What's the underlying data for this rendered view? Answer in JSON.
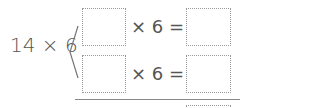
{
  "problem": {
    "expression": "14 × 6",
    "rows": [
      {
        "multiplicand": "",
        "operator": "× 6 =",
        "result": ""
      },
      {
        "multiplicand": "",
        "operator": "× 6 =",
        "result": ""
      }
    ],
    "total": ""
  }
}
